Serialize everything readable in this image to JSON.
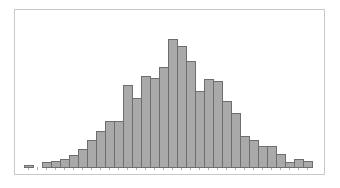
{
  "chart_data": {
    "type": "bar",
    "subtype": "histogram",
    "title": "",
    "xlabel": "",
    "ylabel": "",
    "grid": false,
    "legend": null,
    "bar_color": "#a9a9a9",
    "edge_color": "#6e6e6e",
    "frame_color": "#c8c8c8",
    "bins": 33,
    "values": [
      2,
      0,
      5,
      6,
      8,
      12,
      18,
      27,
      36,
      46,
      46,
      82,
      69,
      91,
      89,
      100,
      128,
      121,
      106,
      76,
      88,
      86,
      66,
      54,
      31,
      27,
      21,
      21,
      13,
      5,
      8,
      6
    ],
    "ylim": [
      0,
      135
    ]
  }
}
